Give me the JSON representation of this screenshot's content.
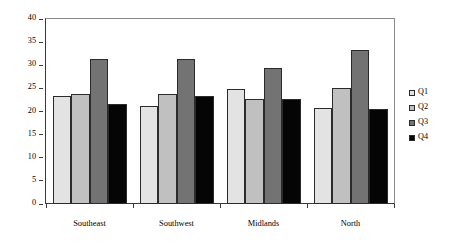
{
  "chart_data": {
    "type": "bar",
    "title": "",
    "subtitle": "",
    "xlabel": "",
    "ylabel": "Pecent of Days Worked in the Year",
    "ylim": [
      0,
      40
    ],
    "ytick_labels": [
      "0",
      "5",
      "10",
      "15",
      "20",
      "25",
      "30",
      "35",
      "40"
    ],
    "ytick_values": [
      0,
      5,
      10,
      15,
      20,
      25,
      30,
      35,
      40
    ],
    "grid": false,
    "legend_position": "right",
    "categories": [
      "Southeast",
      "Southwest",
      "Midlands",
      "North"
    ],
    "series": [
      {
        "name": "Q1",
        "color": "#e3e3e3",
        "values": [
          23.3,
          21.3,
          24.8,
          20.7
        ]
      },
      {
        "name": "Q2",
        "color": "#c0c0c0",
        "values": [
          23.7,
          23.7,
          22.7,
          25.1
        ]
      },
      {
        "name": "Q3",
        "color": "#737373",
        "values": [
          31.4,
          31.4,
          29.5,
          33.2
        ]
      },
      {
        "name": "Q4",
        "color": "#050505",
        "values": [
          21.7,
          23.3,
          22.7,
          20.6
        ]
      }
    ]
  }
}
